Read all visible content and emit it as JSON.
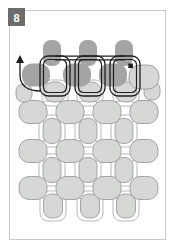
{
  "figure": {
    "step_number": "8",
    "caption": "Bead weaving diagram step 8: black thread path with start arrow and square end marker stitched through three new-row bead units above the woven bead fabric",
    "colors": {
      "background": "#ffffff",
      "frame_border": "#c9c9c9",
      "badge_bg": "#6d6d6d",
      "badge_text": "#ffffff",
      "bead_dark": "#a4a4a4",
      "bead_light": "#d6d8d6",
      "bead_light_outline": "#909494",
      "thread_gray": "#b7b9b7",
      "thread_black": "#1f1f1f"
    },
    "frame": {
      "x": 9.5,
      "y": 10.5,
      "w": 156,
      "h": 229
    },
    "badge": {
      "x": 8,
      "y": 8,
      "w": 17,
      "h": 18,
      "label_x": 16.5,
      "label_y": 17.5
    },
    "beads": {
      "dark": [
        {
          "cx": 52,
          "cy": 53,
          "w": 18,
          "h": 26,
          "r": 8
        },
        {
          "cx": 88,
          "cy": 53,
          "w": 18,
          "h": 26,
          "r": 8
        },
        {
          "cx": 124,
          "cy": 53,
          "w": 18,
          "h": 26,
          "r": 8
        },
        {
          "cx": 36,
          "cy": 75,
          "w": 28,
          "h": 23,
          "r": 10
        },
        {
          "cx": 77,
          "cy": 75,
          "w": 28,
          "h": 23,
          "r": 10
        },
        {
          "cx": 113,
          "cy": 75,
          "w": 28,
          "h": 23,
          "r": 10
        }
      ],
      "light": [
        {
          "cx": 53,
          "cy": 206,
          "w": 19,
          "h": 24,
          "r": 8
        },
        {
          "cx": 90,
          "cy": 206,
          "w": 19,
          "h": 24,
          "r": 8
        },
        {
          "cx": 126,
          "cy": 206,
          "w": 19,
          "h": 24,
          "r": 8
        },
        {
          "cx": 33,
          "cy": 188,
          "w": 28,
          "h": 23,
          "r": 10
        },
        {
          "cx": 70,
          "cy": 188,
          "w": 28,
          "h": 23,
          "r": 10
        },
        {
          "cx": 107,
          "cy": 188,
          "w": 28,
          "h": 23,
          "r": 10
        },
        {
          "cx": 144,
          "cy": 188,
          "w": 28,
          "h": 23,
          "r": 10
        },
        {
          "cx": 52,
          "cy": 170,
          "w": 18,
          "h": 25,
          "r": 8
        },
        {
          "cx": 88,
          "cy": 170,
          "w": 18,
          "h": 25,
          "r": 8
        },
        {
          "cx": 124,
          "cy": 170,
          "w": 18,
          "h": 25,
          "r": 8
        },
        {
          "cx": 33,
          "cy": 151,
          "w": 28,
          "h": 23,
          "r": 10
        },
        {
          "cx": 70,
          "cy": 151,
          "w": 28,
          "h": 23,
          "r": 10
        },
        {
          "cx": 107,
          "cy": 151,
          "w": 28,
          "h": 23,
          "r": 10
        },
        {
          "cx": 144,
          "cy": 151,
          "w": 28,
          "h": 23,
          "r": 10
        },
        {
          "cx": 52,
          "cy": 131,
          "w": 18,
          "h": 25,
          "r": 8
        },
        {
          "cx": 88,
          "cy": 131,
          "w": 18,
          "h": 25,
          "r": 8
        },
        {
          "cx": 124,
          "cy": 131,
          "w": 18,
          "h": 25,
          "r": 8
        },
        {
          "cx": 33,
          "cy": 112,
          "w": 28,
          "h": 23,
          "r": 10
        },
        {
          "cx": 70,
          "cy": 112,
          "w": 28,
          "h": 23,
          "r": 10
        },
        {
          "cx": 107,
          "cy": 112,
          "w": 28,
          "h": 23,
          "r": 10
        },
        {
          "cx": 144,
          "cy": 112,
          "w": 28,
          "h": 23,
          "r": 10
        },
        {
          "cx": 24,
          "cy": 93,
          "w": 16,
          "h": 18,
          "r": 7
        },
        {
          "cx": 55,
          "cy": 92,
          "w": 22,
          "h": 20,
          "r": 9
        },
        {
          "cx": 90,
          "cy": 92,
          "w": 22,
          "h": 20,
          "r": 9
        },
        {
          "cx": 126,
          "cy": 92,
          "w": 22,
          "h": 20,
          "r": 9
        },
        {
          "cx": 152,
          "cy": 91,
          "w": 16,
          "h": 18,
          "r": 7
        },
        {
          "cx": 144,
          "cy": 77,
          "w": 30,
          "h": 24,
          "r": 11
        }
      ]
    },
    "thread_arcs": [
      {
        "cx": 55,
        "cy": 93,
        "w": 26,
        "h": 26
      },
      {
        "cx": 90,
        "cy": 93,
        "w": 26,
        "h": 26
      },
      {
        "cx": 126,
        "cy": 93,
        "w": 26,
        "h": 26
      },
      {
        "cx": 52,
        "cy": 112,
        "w": 26,
        "h": 22
      },
      {
        "cx": 88,
        "cy": 112,
        "w": 26,
        "h": 22
      },
      {
        "cx": 124,
        "cy": 112,
        "w": 26,
        "h": 22
      },
      {
        "cx": 52,
        "cy": 131,
        "w": 26,
        "h": 32
      },
      {
        "cx": 88,
        "cy": 131,
        "w": 26,
        "h": 32
      },
      {
        "cx": 124,
        "cy": 131,
        "w": 26,
        "h": 32
      },
      {
        "cx": 52,
        "cy": 151,
        "w": 26,
        "h": 22
      },
      {
        "cx": 88,
        "cy": 151,
        "w": 26,
        "h": 22
      },
      {
        "cx": 124,
        "cy": 151,
        "w": 26,
        "h": 22
      },
      {
        "cx": 52,
        "cy": 170,
        "w": 26,
        "h": 32
      },
      {
        "cx": 88,
        "cy": 170,
        "w": 26,
        "h": 32
      },
      {
        "cx": 124,
        "cy": 170,
        "w": 26,
        "h": 32
      },
      {
        "cx": 52,
        "cy": 188,
        "w": 26,
        "h": 22
      },
      {
        "cx": 88,
        "cy": 188,
        "w": 26,
        "h": 22
      },
      {
        "cx": 124,
        "cy": 188,
        "w": 26,
        "h": 22
      },
      {
        "cx": 53,
        "cy": 206,
        "w": 26,
        "h": 30
      },
      {
        "cx": 90,
        "cy": 206,
        "w": 26,
        "h": 30
      },
      {
        "cx": 126,
        "cy": 206,
        "w": 26,
        "h": 30
      }
    ],
    "black_path": {
      "connectors": [
        {
          "x1": 55,
          "y1": 56.2,
          "x2": 125,
          "y2": 56.2
        },
        {
          "x1": 55,
          "y1": 59.8,
          "x2": 125,
          "y2": 59.8
        }
      ],
      "loops_outer": [
        {
          "x": 40,
          "y": 56,
          "w": 30,
          "h": 40,
          "r": 8
        },
        {
          "x": 75,
          "y": 56,
          "w": 30,
          "h": 40,
          "r": 8
        },
        {
          "x": 110,
          "y": 56,
          "w": 30,
          "h": 40,
          "r": 8
        }
      ],
      "loops_inner": [
        {
          "x": 43.5,
          "y": 59.5,
          "w": 23,
          "h": 33,
          "r": 5
        },
        {
          "x": 78.5,
          "y": 59.5,
          "w": 23,
          "h": 33,
          "r": 5
        },
        {
          "x": 113.5,
          "y": 59.5,
          "w": 23,
          "h": 33,
          "r": 5
        }
      ],
      "start_arrow": {
        "curve": "M 41,91 C 28,91 20,86 20,75 L 20,62",
        "head_points": "20,55 16,63 24,63"
      },
      "end_dot": {
        "x": 128.3,
        "y": 63.5,
        "size": 4.6
      }
    }
  }
}
